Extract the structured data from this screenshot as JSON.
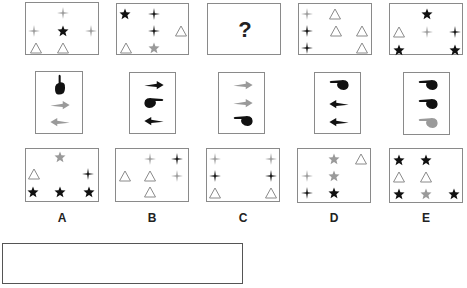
{
  "colors": {
    "black": "#111111",
    "gray": "#9a9a9a",
    "triangle": "#8a8a8a",
    "border": "#8a8a8a"
  },
  "top_row": [
    {
      "id": "t1",
      "x": 25,
      "y": 2,
      "w": 74,
      "h": 53,
      "items": [
        {
          "shape": "cross",
          "color": "gray",
          "cx": 37,
          "cy": 10
        },
        {
          "shape": "cross",
          "color": "gray",
          "cx": 8,
          "cy": 28
        },
        {
          "shape": "star",
          "color": "black",
          "cx": 37,
          "cy": 28
        },
        {
          "shape": "cross",
          "color": "gray",
          "cx": 65,
          "cy": 28
        },
        {
          "shape": "triangle",
          "color": "gray",
          "cx": 10,
          "cy": 45
        },
        {
          "shape": "triangle",
          "color": "gray",
          "cx": 37,
          "cy": 45
        }
      ]
    },
    {
      "id": "t2",
      "x": 116,
      "y": 3,
      "w": 73,
      "h": 52,
      "items": [
        {
          "shape": "star",
          "color": "black",
          "cx": 8,
          "cy": 10
        },
        {
          "shape": "cross",
          "color": "black",
          "cx": 37,
          "cy": 10
        },
        {
          "shape": "cross",
          "color": "black",
          "cx": 37,
          "cy": 27
        },
        {
          "shape": "triangle",
          "color": "gray",
          "cx": 64,
          "cy": 27
        },
        {
          "shape": "triangle",
          "color": "gray",
          "cx": 9,
          "cy": 44
        },
        {
          "shape": "star",
          "color": "gray",
          "cx": 37,
          "cy": 44
        }
      ]
    },
    {
      "id": "t3",
      "x": 207,
      "y": 3,
      "w": 74,
      "h": 52,
      "question": "?",
      "items": []
    },
    {
      "id": "t4",
      "x": 298,
      "y": 3,
      "w": 74,
      "h": 52,
      "items": [
        {
          "shape": "cross",
          "color": "gray",
          "cx": 8,
          "cy": 10
        },
        {
          "shape": "triangle",
          "color": "gray",
          "cx": 36,
          "cy": 10
        },
        {
          "shape": "cross",
          "color": "black",
          "cx": 8,
          "cy": 27
        },
        {
          "shape": "triangle",
          "color": "gray",
          "cx": 37,
          "cy": 27
        },
        {
          "shape": "triangle",
          "color": "gray",
          "cx": 63,
          "cy": 27
        },
        {
          "shape": "cross",
          "color": "black",
          "cx": 8,
          "cy": 44
        },
        {
          "shape": "triangle",
          "color": "gray",
          "cx": 63,
          "cy": 44
        }
      ]
    },
    {
      "id": "t5",
      "x": 389,
      "y": 3,
      "w": 74,
      "h": 52,
      "items": [
        {
          "shape": "star",
          "color": "black",
          "cx": 37,
          "cy": 10
        },
        {
          "shape": "triangle",
          "color": "gray",
          "cx": 9,
          "cy": 28
        },
        {
          "shape": "cross",
          "color": "gray",
          "cx": 37,
          "cy": 28
        },
        {
          "shape": "cross",
          "color": "black",
          "cx": 65,
          "cy": 28
        },
        {
          "shape": "star",
          "color": "black",
          "cx": 9,
          "cy": 46
        },
        {
          "shape": "star",
          "color": "black",
          "cx": 65,
          "cy": 46
        }
      ]
    }
  ],
  "middle_row": [
    {
      "id": "m1",
      "x": 35,
      "y": 71,
      "w": 48,
      "h": 63,
      "items": [
        {
          "shape": "hand-up",
          "color": "black",
          "cy": 13
        },
        {
          "shape": "arrow-right",
          "color": "gray",
          "cy": 33
        },
        {
          "shape": "arrow-left",
          "color": "gray",
          "cy": 50
        }
      ]
    },
    {
      "id": "m2",
      "x": 129,
      "y": 72,
      "w": 47,
      "h": 62,
      "items": [
        {
          "shape": "arrow-right",
          "color": "black",
          "cy": 12
        },
        {
          "shape": "hand-right",
          "color": "black",
          "cy": 30
        },
        {
          "shape": "arrow-left",
          "color": "black",
          "cy": 48
        }
      ]
    },
    {
      "id": "m3",
      "x": 218,
      "y": 72,
      "w": 47,
      "h": 62,
      "items": [
        {
          "shape": "arrow-right",
          "color": "gray",
          "cy": 12
        },
        {
          "shape": "arrow-right",
          "color": "gray",
          "cy": 30
        },
        {
          "shape": "hand-left",
          "color": "black",
          "cy": 48
        }
      ]
    },
    {
      "id": "m4",
      "x": 314,
      "y": 72,
      "w": 47,
      "h": 62,
      "items": [
        {
          "shape": "hand-left",
          "color": "black",
          "cy": 12
        },
        {
          "shape": "arrow-left",
          "color": "black",
          "cy": 31
        },
        {
          "shape": "arrow-left",
          "color": "black",
          "cy": 49
        }
      ]
    },
    {
      "id": "m5",
      "x": 403,
      "y": 72,
      "w": 47,
      "h": 63,
      "items": [
        {
          "shape": "hand-left",
          "color": "black",
          "cy": 12
        },
        {
          "shape": "hand-left",
          "color": "black",
          "cy": 31
        },
        {
          "shape": "hand-left",
          "color": "gray",
          "cy": 50
        }
      ]
    }
  ],
  "options": [
    {
      "id": "A",
      "label": "A",
      "x": 25,
      "y": 148,
      "w": 74,
      "h": 54,
      "items": [
        {
          "shape": "star",
          "color": "gray",
          "cx": 34,
          "cy": 8
        },
        {
          "shape": "triangle",
          "color": "gray",
          "cx": 8,
          "cy": 25
        },
        {
          "shape": "cross",
          "color": "black",
          "cx": 62,
          "cy": 25
        },
        {
          "shape": "star",
          "color": "black",
          "cx": 7,
          "cy": 43
        },
        {
          "shape": "star",
          "color": "black",
          "cx": 34,
          "cy": 43
        },
        {
          "shape": "star",
          "color": "black",
          "cx": 63,
          "cy": 43
        }
      ]
    },
    {
      "id": "B",
      "label": "B",
      "x": 115,
      "y": 148,
      "w": 74,
      "h": 54,
      "items": [
        {
          "shape": "cross",
          "color": "gray",
          "cx": 34,
          "cy": 10
        },
        {
          "shape": "cross",
          "color": "black",
          "cx": 61,
          "cy": 10
        },
        {
          "shape": "triangle",
          "color": "gray",
          "cx": 9,
          "cy": 27
        },
        {
          "shape": "triangle",
          "color": "gray",
          "cx": 34,
          "cy": 27
        },
        {
          "shape": "cross",
          "color": "gray",
          "cx": 61,
          "cy": 27
        },
        {
          "shape": "triangle",
          "color": "gray",
          "cx": 34,
          "cy": 43
        }
      ]
    },
    {
      "id": "C",
      "label": "C",
      "x": 206,
      "y": 148,
      "w": 74,
      "h": 54,
      "items": [
        {
          "shape": "cross",
          "color": "gray",
          "cx": 8,
          "cy": 10
        },
        {
          "shape": "cross",
          "color": "gray",
          "cx": 64,
          "cy": 10
        },
        {
          "shape": "cross",
          "color": "black",
          "cx": 8,
          "cy": 27
        },
        {
          "shape": "cross",
          "color": "black",
          "cx": 64,
          "cy": 27
        },
        {
          "shape": "triangle",
          "color": "gray",
          "cx": 8,
          "cy": 44
        },
        {
          "shape": "triangle",
          "color": "gray",
          "cx": 64,
          "cy": 44
        }
      ]
    },
    {
      "id": "D",
      "label": "D",
      "x": 297,
      "y": 148,
      "w": 74,
      "h": 55,
      "items": [
        {
          "shape": "star",
          "color": "gray",
          "cx": 36,
          "cy": 10
        },
        {
          "shape": "triangle",
          "color": "gray",
          "cx": 63,
          "cy": 10
        },
        {
          "shape": "cross",
          "color": "gray",
          "cx": 9,
          "cy": 27
        },
        {
          "shape": "star",
          "color": "gray",
          "cx": 36,
          "cy": 27
        },
        {
          "shape": "cross",
          "color": "black",
          "cx": 9,
          "cy": 44
        },
        {
          "shape": "star",
          "color": "black",
          "cx": 36,
          "cy": 44
        }
      ]
    },
    {
      "id": "E",
      "label": "E",
      "x": 389,
      "y": 148,
      "w": 74,
      "h": 55,
      "items": [
        {
          "shape": "star",
          "color": "black",
          "cx": 9,
          "cy": 11
        },
        {
          "shape": "star",
          "color": "black",
          "cx": 36,
          "cy": 11
        },
        {
          "shape": "triangle",
          "color": "gray",
          "cx": 9,
          "cy": 28
        },
        {
          "shape": "triangle",
          "color": "gray",
          "cx": 36,
          "cy": 28
        },
        {
          "shape": "star",
          "color": "black",
          "cx": 9,
          "cy": 45
        },
        {
          "shape": "star",
          "color": "gray",
          "cx": 36,
          "cy": 45
        },
        {
          "shape": "star",
          "color": "black",
          "cx": 64,
          "cy": 45
        }
      ]
    }
  ],
  "option_labels_y": 211,
  "answer_box": {
    "x": 2,
    "y": 243,
    "w": 241,
    "h": 41,
    "value": ""
  }
}
